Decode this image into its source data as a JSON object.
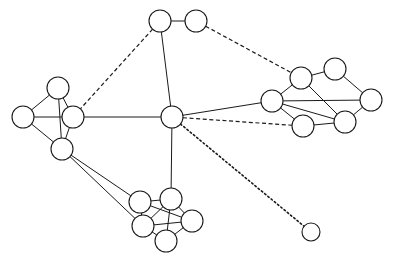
{
  "figure": {
    "background_color": "#ffffff",
    "stroke_color": "#1a1a1a",
    "node_fill_color": "#ffffff",
    "width": 395,
    "height": 266
  },
  "chart_data": {
    "type": "diagram",
    "subtype": "node-link-network-graph",
    "title": "",
    "xlabel": "",
    "ylabel": "",
    "grid": false,
    "legend": false,
    "axis_visible": false,
    "node_count": 22,
    "edge_count": 40,
    "cluster_count": 5,
    "edge_styles": [
      "solid",
      "dashed",
      "dotted"
    ],
    "nodes": [
      {
        "id": "t1",
        "x": 160,
        "y": 21,
        "r": 11,
        "cluster": "top-pair"
      },
      {
        "id": "t2",
        "x": 196,
        "y": 21,
        "r": 11,
        "cluster": "top-pair"
      },
      {
        "id": "l1",
        "x": 58,
        "y": 88,
        "r": 11,
        "cluster": "left"
      },
      {
        "id": "l2",
        "x": 23,
        "y": 117,
        "r": 11,
        "cluster": "left"
      },
      {
        "id": "l3",
        "x": 73,
        "y": 117,
        "r": 11,
        "cluster": "left"
      },
      {
        "id": "l4",
        "x": 62,
        "y": 149,
        "r": 11,
        "cluster": "left"
      },
      {
        "id": "hub",
        "x": 172,
        "y": 117,
        "r": 11,
        "cluster": "center"
      },
      {
        "id": "r1",
        "x": 301,
        "y": 78,
        "r": 11,
        "cluster": "right"
      },
      {
        "id": "r2",
        "x": 335,
        "y": 69,
        "r": 11,
        "cluster": "right"
      },
      {
        "id": "r3",
        "x": 371,
        "y": 100,
        "r": 11,
        "cluster": "right"
      },
      {
        "id": "r4",
        "x": 272,
        "y": 101,
        "r": 11,
        "cluster": "right"
      },
      {
        "id": "r5",
        "x": 345,
        "y": 122,
        "r": 11,
        "cluster": "right"
      },
      {
        "id": "r6",
        "x": 303,
        "y": 126,
        "r": 11,
        "cluster": "right"
      },
      {
        "id": "b1",
        "x": 140,
        "y": 202,
        "r": 11,
        "cluster": "bottom"
      },
      {
        "id": "b2",
        "x": 171,
        "y": 199,
        "r": 11,
        "cluster": "bottom"
      },
      {
        "id": "b3",
        "x": 143,
        "y": 226,
        "r": 11,
        "cluster": "bottom"
      },
      {
        "id": "b4",
        "x": 192,
        "y": 221,
        "r": 11,
        "cluster": "bottom"
      },
      {
        "id": "b5",
        "x": 166,
        "y": 241,
        "r": 11,
        "cluster": "bottom"
      },
      {
        "id": "iso",
        "x": 311,
        "y": 232,
        "r": 9,
        "cluster": "isolated"
      }
    ],
    "edges": [
      {
        "from": "t1",
        "to": "t2",
        "style": "solid"
      },
      {
        "from": "t1",
        "to": "hub",
        "style": "solid"
      },
      {
        "from": "t1",
        "to": "l3",
        "style": "dashed"
      },
      {
        "from": "t2",
        "to": "r1",
        "style": "dashed"
      },
      {
        "from": "l1",
        "to": "l2",
        "style": "solid"
      },
      {
        "from": "l1",
        "to": "l3",
        "style": "solid"
      },
      {
        "from": "l1",
        "to": "l4",
        "style": "solid"
      },
      {
        "from": "l2",
        "to": "l3",
        "style": "solid"
      },
      {
        "from": "l2",
        "to": "l4",
        "style": "solid"
      },
      {
        "from": "l3",
        "to": "l4",
        "style": "solid"
      },
      {
        "from": "l3",
        "to": "hub",
        "style": "solid"
      },
      {
        "from": "l4",
        "to": "b1",
        "style": "solid"
      },
      {
        "from": "l4",
        "to": "b3",
        "style": "solid"
      },
      {
        "from": "hub",
        "to": "r4",
        "style": "solid"
      },
      {
        "from": "hub",
        "to": "r6",
        "style": "dashed"
      },
      {
        "from": "hub",
        "to": "b2",
        "style": "solid"
      },
      {
        "from": "hub",
        "to": "iso",
        "style": "dotted"
      },
      {
        "from": "r1",
        "to": "r2",
        "style": "solid"
      },
      {
        "from": "r1",
        "to": "r4",
        "style": "solid"
      },
      {
        "from": "r1",
        "to": "r5",
        "style": "solid"
      },
      {
        "from": "r2",
        "to": "r3",
        "style": "solid"
      },
      {
        "from": "r3",
        "to": "r4",
        "style": "solid"
      },
      {
        "from": "r3",
        "to": "r5",
        "style": "solid"
      },
      {
        "from": "r4",
        "to": "r5",
        "style": "solid"
      },
      {
        "from": "r4",
        "to": "r6",
        "style": "solid"
      },
      {
        "from": "r5",
        "to": "r6",
        "style": "solid"
      },
      {
        "from": "b1",
        "to": "b2",
        "style": "solid"
      },
      {
        "from": "b1",
        "to": "b3",
        "style": "solid"
      },
      {
        "from": "b1",
        "to": "b4",
        "style": "solid"
      },
      {
        "from": "b2",
        "to": "b3",
        "style": "solid"
      },
      {
        "from": "b2",
        "to": "b4",
        "style": "solid"
      },
      {
        "from": "b2",
        "to": "b5",
        "style": "solid"
      },
      {
        "from": "b3",
        "to": "b4",
        "style": "solid"
      },
      {
        "from": "b3",
        "to": "b5",
        "style": "solid"
      },
      {
        "from": "b4",
        "to": "b5",
        "style": "solid"
      }
    ]
  }
}
